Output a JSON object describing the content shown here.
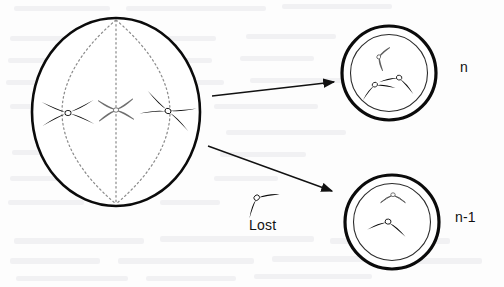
{
  "figure": {
    "background_color": "#fdfdfd",
    "ink_color": "#111111",
    "spindle_color": "#8a8a8a"
  },
  "parent_cell": {
    "name": "dividing-cell",
    "stage": "metaphase",
    "center_x": 116,
    "center_y": 112,
    "radius_x": 84,
    "radius_y": 94,
    "chromosome_count": 3,
    "chromosomes": [
      {
        "id": "left-black",
        "shape": "X",
        "fill": "black",
        "cx": 68,
        "cy": 113
      },
      {
        "id": "center-outline",
        "shape": "X",
        "fill": "white",
        "cx": 116,
        "cy": 110
      },
      {
        "id": "right-black",
        "shape": "X",
        "fill": "black",
        "cx": 168,
        "cy": 111
      }
    ],
    "spindle": {
      "pole_top_x": 116,
      "pole_top_y": 20,
      "pole_bottom_x": 116,
      "pole_bottom_y": 204,
      "fiber_count": 3,
      "style": "dotted"
    }
  },
  "arrows": [
    {
      "name": "arrow-to-normal-cell",
      "x1": 212,
      "y1": 96,
      "x2": 336,
      "y2": 82
    },
    {
      "name": "arrow-to-aneuploid-cell",
      "x1": 208,
      "y1": 146,
      "x2": 334,
      "y2": 192
    }
  ],
  "lost_chromosome": {
    "label": "Lost",
    "shape": "V",
    "fill": "black",
    "cx": 257,
    "cy": 198
  },
  "daughter_cells": [
    {
      "name": "daughter-cell-normal",
      "label": "n",
      "label_x": 460,
      "label_y": 59,
      "center_x": 389,
      "center_y": 73,
      "outer_radius": 47,
      "inner_radius": 38,
      "chromosome_count": 3,
      "chromosomes": [
        {
          "id": "small-outline",
          "shape": "V",
          "fill": "white",
          "cx": 379,
          "cy": 57
        },
        {
          "id": "left-black",
          "shape": "V",
          "fill": "black",
          "cx": 375,
          "cy": 84
        },
        {
          "id": "right-black",
          "shape": "V",
          "fill": "black",
          "cx": 400,
          "cy": 78
        }
      ]
    },
    {
      "name": "daughter-cell-aneuploid",
      "label": "n-1",
      "label_x": 455,
      "label_y": 209,
      "center_x": 392,
      "center_y": 222,
      "outer_radius": 47,
      "inner_radius": 38,
      "chromosome_count": 2,
      "chromosomes": [
        {
          "id": "top-outline",
          "shape": "V",
          "fill": "white",
          "cx": 393,
          "cy": 194
        },
        {
          "id": "center-black",
          "shape": "V",
          "fill": "black",
          "cx": 389,
          "cy": 222
        }
      ]
    }
  ]
}
